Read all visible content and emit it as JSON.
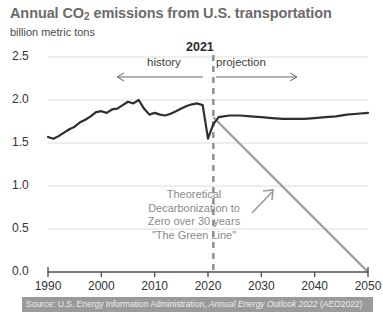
{
  "chart_data": {
    "type": "line",
    "title": "Annual CO2 emissions from U.S. transportation",
    "title_prefix": "Annual CO",
    "title_sub": "2",
    "title_suffix": " emissions from U.S. transportation",
    "ylabel": "billion metric tons",
    "xlabel": "",
    "xlim": [
      1990,
      2050
    ],
    "ylim": [
      0.0,
      2.5
    ],
    "grid": true,
    "legend_position": "none",
    "divider_year": "2021",
    "phase_left_label": "history",
    "phase_right_label": "projection",
    "ytick_labels": [
      "2.5",
      "2.0",
      "1.5",
      "1.0",
      "0.5",
      "0.0"
    ],
    "ytick_values": [
      2.5,
      2.0,
      1.5,
      1.0,
      0.5,
      0.0
    ],
    "xtick_labels": [
      "1990",
      "2000",
      "2010",
      "2020",
      "2030",
      "2040",
      "2050"
    ],
    "xtick_values": [
      1990,
      2000,
      2010,
      2020,
      2030,
      2040,
      2050
    ],
    "series": [
      {
        "name": "history",
        "color": "#2e2e2e",
        "x": [
          1990,
          1991,
          1992,
          1993,
          1994,
          1995,
          1996,
          1997,
          1998,
          1999,
          2000,
          2001,
          2002,
          2003,
          2004,
          2005,
          2006,
          2007,
          2008,
          2009,
          2010,
          2011,
          2012,
          2013,
          2014,
          2015,
          2016,
          2017,
          2018,
          2019,
          2020,
          2021
        ],
        "values": [
          1.57,
          1.55,
          1.58,
          1.62,
          1.66,
          1.69,
          1.74,
          1.77,
          1.81,
          1.86,
          1.87,
          1.85,
          1.89,
          1.9,
          1.94,
          1.98,
          1.96,
          2.0,
          1.9,
          1.83,
          1.85,
          1.83,
          1.82,
          1.84,
          1.87,
          1.9,
          1.93,
          1.95,
          1.96,
          1.94,
          1.55,
          1.72
        ]
      },
      {
        "name": "projection",
        "color": "#2e2e2e",
        "x": [
          2021,
          2022,
          2024,
          2026,
          2028,
          2030,
          2032,
          2034,
          2036,
          2038,
          2040,
          2042,
          2044,
          2046,
          2048,
          2050
        ],
        "values": [
          1.72,
          1.8,
          1.82,
          1.82,
          1.81,
          1.8,
          1.79,
          1.78,
          1.78,
          1.78,
          1.79,
          1.8,
          1.81,
          1.83,
          1.84,
          1.85
        ]
      },
      {
        "name": "Theoretical Decarbonization to Zero",
        "color": "#9b9b9b",
        "x": [
          2021,
          2050
        ],
        "values": [
          1.8,
          0.0
        ]
      }
    ],
    "annotation": "Theoretical\nDecarbonization to\nZero over 30 years\n\"The Green Line\"",
    "source": "Source: U.S. Energy Information Administration, ",
    "source_italic": "Annual Energy Outlook 2022",
    "source_tail": " (AEO2022)"
  },
  "colors": {
    "line": "#2e2e2e",
    "green_line": "#9b9b9b",
    "grid": "#dcdcdc",
    "axis": "#555555",
    "title": "#6b6b6b",
    "source_bar": "#9a9a9a"
  }
}
